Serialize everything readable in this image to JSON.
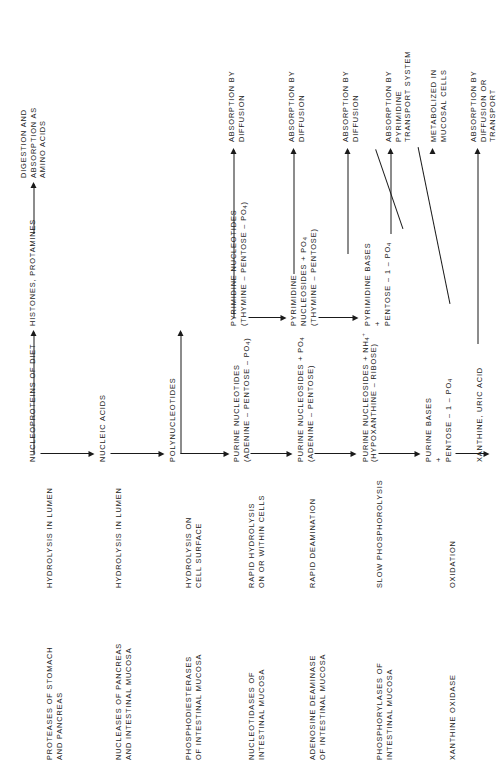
{
  "diagram": {
    "orientation": "rotated-90-ccw",
    "enzymes": [
      "PROTEASES OF STOMACH\nAND PANCREAS",
      "NUCLEASES OF PANCREAS\nAND INTESTINAL MUCOSA",
      "PHOSPHODIESTERASES\nOF INTESTINAL MUCOSA",
      "NUCLEOTIDASES OF\nINTESTINAL MUCOSA",
      "ADENOSINE DEAMINASE\nOF INTESTINAL MUCOSA",
      "PHOSPHORYLASES OF\nINTESTINAL MUCOSA",
      "XANTHINE OXIDASE"
    ],
    "processes": [
      "HYDROLYSIS IN LUMEN",
      "HYDROLYSIS IN LUMEN",
      "HYDROLYSIS ON\nCELL SURFACE",
      "RAPID HYDROLYSIS\nON OR WITHIN CELLS",
      "RAPID DEAMINATION",
      "SLOW PHOSPHOROLYSIS",
      "OXIDATION"
    ],
    "metabolites": {
      "nucleoproteins": "NUCLEOPROTEINS OF DIET",
      "histones": "HISTONES, PROTAMINES",
      "amino_acids": "DIGESTION AND\nABSORPTION AS\nAMINO ACIDS",
      "nucleic_acids": "NUCLEIC ACIDS",
      "polynucleotides": "POLYNUCLEOTIDES",
      "purine_nucleotides_l1": "PURINE NUCLEOTIDES",
      "purine_nucleotides_l2": "(ADENINE – PENTOSE – PO",
      "purine_nucleosides_l1": "PURINE NUCLEOSIDES + PO",
      "purine_nucleosides_l2": "(ADENINE – PENTOSE)",
      "purine_nucleosides_nh4_l1": "PURINE NUCLEOSIDES + NH",
      "purine_nucleosides_nh4_l2": "(HYPOXANTHINE – RIBOSE)",
      "purine_bases_l1": "PURINE BASES",
      "purine_bases_l2": "+",
      "purine_bases_l3": "PENTOSE – 1 – PO",
      "xanthine_uric": "XANTHINE, URIC ACID",
      "pyrimidine_nucleotides_l1": "PYRIMIDINE NUCLEOTIDES",
      "pyrimidine_nucleotides_l2": "(THYMINE – PENTOSE – PO",
      "pyrimidine_nucleosides_l1": "PYRIMIDINE",
      "pyrimidine_nucleosides_l2": "NUCLEOSIDES + PO",
      "pyrimidine_nucleosides_l3": "(THYMINE – PENTOSE)",
      "pyrimidine_bases_l1": "PYRIMIDINE BASES",
      "pyrimidine_bases_l2": "+",
      "pyrimidine_bases_l3": "PENTOSE – 1 – PO"
    },
    "fates": {
      "absorption_diffusion_1": "ABSORPTION BY\nDIFFUSION",
      "absorption_diffusion_2": "ABSORPTION BY\nDIFFUSION",
      "absorption_diffusion_3": "ABSORPTION BY\nDIFFUSION",
      "absorption_pyrimidine_transport": "ABSORPTION BY\nPYRIMIDINE\nTRANSPORT SYSTEM",
      "metabolized_mucosal": "METABOLIZED IN\nMUCOSAL CELLS",
      "absorption_diffusion_transport": "ABSORPTION BY\nDIFFUSION OR\nTRANSPORT"
    },
    "subscripts": {
      "po4": "4",
      "nh4": "4",
      "nh4_charge": "+"
    },
    "colors": {
      "ink": "#1a1a1a",
      "background": "#ffffff"
    }
  }
}
